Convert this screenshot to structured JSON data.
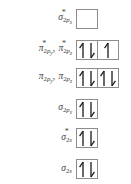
{
  "diagram": {
    "border_color": "#8c8c8c",
    "text_color": "#444444",
    "arrow_color": "#1a1a1a",
    "rows": [
      {
        "id": "sigma-star-2px",
        "label_parts": [
          {
            "base": "σ",
            "star": true,
            "sub": "2",
            "sub_italic": "p",
            "sub2": "x"
          }
        ],
        "boxes": [
          {
            "electrons": []
          }
        ],
        "y": 9
      },
      {
        "id": "pi-star-2py-2pz",
        "label_parts": [
          {
            "base": "π",
            "star": true,
            "sub": "2",
            "sub_italic": "p",
            "sub2": "y",
            "comma": ","
          },
          {
            "base": "π",
            "star": true,
            "sub": "2",
            "sub_italic": "p",
            "sub2": "z"
          }
        ],
        "boxes": [
          {
            "electrons": [
              "up",
              "down"
            ]
          },
          {
            "electrons": [
              "up"
            ]
          }
        ],
        "y": 40
      },
      {
        "id": "pi-2py-2pz",
        "label_parts": [
          {
            "base": "π",
            "star": false,
            "sub": "2",
            "sub_italic": "p",
            "sub2": "y",
            "comma": ","
          },
          {
            "base": "π",
            "star": false,
            "sub": "2",
            "sub_italic": "p",
            "sub2": "z"
          }
        ],
        "boxes": [
          {
            "electrons": [
              "up",
              "down"
            ]
          },
          {
            "electrons": [
              "up",
              "down"
            ]
          }
        ],
        "y": 68
      },
      {
        "id": "sigma-2px",
        "label_parts": [
          {
            "base": "σ",
            "star": false,
            "sub": "2",
            "sub_italic": "p",
            "sub2": "x"
          }
        ],
        "boxes": [
          {
            "electrons": [
              "up",
              "down"
            ]
          }
        ],
        "y": 99
      },
      {
        "id": "sigma-star-2s",
        "label_parts": [
          {
            "base": "σ",
            "star": true,
            "sub": "2",
            "sub_italic": "s",
            "sub2": ""
          }
        ],
        "boxes": [
          {
            "electrons": [
              "up",
              "down"
            ]
          }
        ],
        "y": 128
      },
      {
        "id": "sigma-2s",
        "label_parts": [
          {
            "base": "σ",
            "star": false,
            "sub": "2",
            "sub_italic": "s",
            "sub2": ""
          }
        ],
        "boxes": [
          {
            "electrons": [
              "up",
              "down"
            ]
          }
        ],
        "y": 159
      }
    ]
  }
}
